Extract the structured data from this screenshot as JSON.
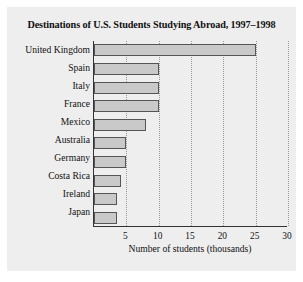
{
  "chart_data": {
    "type": "bar",
    "orientation": "horizontal",
    "title": "Destinations of U.S. Students Studying Abroad, 1997–1998",
    "xlabel": "Number of students (thousands)",
    "ylabel": "",
    "categories": [
      "United Kingdom",
      "Spain",
      "Italy",
      "France",
      "Mexico",
      "Australia",
      "Germany",
      "Costa Rica",
      "Ireland",
      "Japan"
    ],
    "values": [
      25.0,
      10.0,
      10.0,
      10.0,
      8.0,
      5.0,
      5.0,
      4.2,
      3.5,
      3.6
    ],
    "xlim": [
      0,
      30
    ],
    "xticks": [
      5,
      10,
      15,
      20,
      25,
      30
    ],
    "xtick_labels": [
      "5",
      "10",
      "15",
      "20",
      "25",
      "30"
    ],
    "grid": "vertical-dotted",
    "legend": "none",
    "bar_color": "#c9c9c9",
    "bar_edge_color": "#555555",
    "panel_color": "#eeeeee"
  }
}
